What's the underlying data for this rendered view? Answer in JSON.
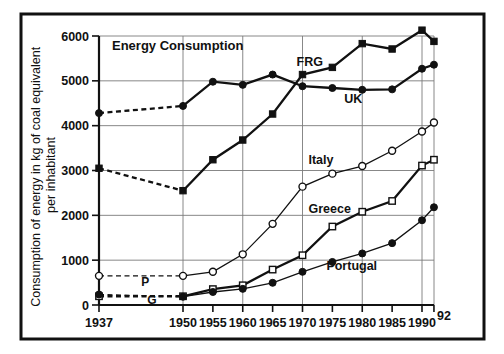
{
  "figure": {
    "title": "Energy Consumption",
    "border_color": "#111111",
    "background": "#ffffff"
  },
  "chart_data": {
    "type": "line",
    "title": "Energy Consumption",
    "xlabel": "",
    "ylabel": "Consumption of energy in kg of coal equivalent per inhabitant",
    "x": [
      1937,
      1950,
      1955,
      1960,
      1965,
      1970,
      1975,
      1980,
      1985,
      1990,
      1992
    ],
    "xtick_labels": [
      "1937",
      "1950",
      "1955",
      "1960",
      "1965",
      "1970",
      "1975",
      "1980",
      "1985",
      "1990",
      "92"
    ],
    "ytick_labels": [
      "0",
      "1000",
      "2000",
      "3000",
      "4000",
      "5000",
      "6000"
    ],
    "yticks": [
      0,
      1000,
      2000,
      3000,
      4000,
      5000,
      6000
    ],
    "xlim": [
      1937,
      1992
    ],
    "ylim": [
      0,
      6000
    ],
    "grid": "both",
    "legend": "inline-labels",
    "units": "kg of coal equivalent per inhabitant",
    "series": [
      {
        "name": "FRG",
        "label": "FRG",
        "marker": "filled-square",
        "line": "thick",
        "dashed_from_1937_to_1950": true,
        "values": [
          3050,
          2550,
          3240,
          3680,
          4260,
          5140,
          5300,
          5830,
          5710,
          6130,
          5880
        ],
        "label_x": 1969,
        "label_y": 5340
      },
      {
        "name": "UK",
        "label": "UK",
        "marker": "filled-circle",
        "line": "thick",
        "dashed_from_1937_to_1950": true,
        "values": [
          4280,
          4440,
          4980,
          4910,
          5140,
          4880,
          4840,
          4800,
          4810,
          5270,
          5360
        ],
        "label_x": 1977,
        "label_y": 4500
      },
      {
        "name": "Italy",
        "label": "Italy",
        "marker": "open-circle",
        "line": "thin",
        "dashed_from_1937_to_1950": true,
        "values": [
          650,
          650,
          740,
          1130,
          1810,
          2640,
          2930,
          3100,
          3440,
          3870,
          4070
        ],
        "label_x": 1971,
        "label_y": 3140
      },
      {
        "name": "Greece",
        "label": "Greece",
        "marker": "open-square",
        "line": "thick",
        "dashed_from_1937_to_1950": true,
        "values": [
          195,
          195,
          355,
          440,
          790,
          1110,
          1750,
          2080,
          2320,
          3110,
          3240
        ],
        "label_x": 1971,
        "label_y": 2060
      },
      {
        "name": "Portugal",
        "label": "Portugal",
        "marker": "filled-circle",
        "line": "thin",
        "dashed_from_1937_to_1950": true,
        "values": [
          235,
          185,
          290,
          360,
          495,
          740,
          960,
          1150,
          1380,
          1890,
          2180
        ],
        "label_x": 1974,
        "label_y": 790
      }
    ],
    "inline_annotations": [
      {
        "text": "P",
        "x": 1943,
        "y": 430,
        "name": "portugal-short-label"
      },
      {
        "text": "G",
        "x": 1944,
        "y": 30,
        "name": "greece-short-label"
      }
    ]
  }
}
